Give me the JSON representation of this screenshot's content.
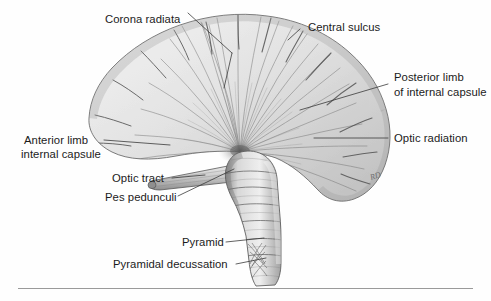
{
  "figure": {
    "style": "grayscale pencil anatomical illustration",
    "background_color": "#fefefe",
    "text_color": "#1b1b1b",
    "leader_color": "#3a3a3a",
    "rule_color": "#9a9a9a",
    "artist_mark": "RD"
  },
  "labels": {
    "corona_radiata": "Corona radiata",
    "central_sulcus": "Central sulcus",
    "posterior_limb_line1": "Posterior limb",
    "posterior_limb_line2": "of internal capsule",
    "optic_radiation": "Optic radiation",
    "anterior_limb_line1": "Anterior limb",
    "anterior_limb_line2": "internal capsule",
    "optic_tract": "Optic tract",
    "pes_pedunculi": "Pes pedunculi",
    "pyramid": "Pyramid",
    "pyramidal_decussation": "Pyramidal decussation"
  }
}
